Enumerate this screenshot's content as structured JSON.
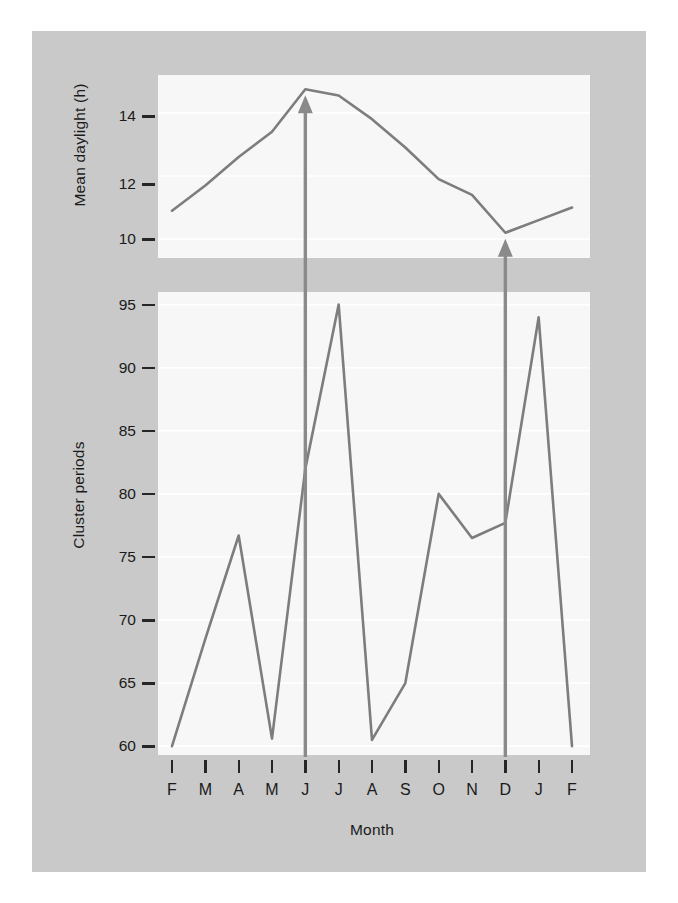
{
  "figure": {
    "background_color": "#c9c9c9",
    "panel_color": "#f7f7f7",
    "line_color": "#7d7d7d",
    "arrow_color": "#8a8a8a",
    "text_color": "#1a1a1a",
    "grid_color": "#ffffff"
  },
  "xaxis": {
    "label": "Month",
    "categories": [
      "F",
      "M",
      "A",
      "M",
      "J",
      "J",
      "A",
      "S",
      "O",
      "N",
      "D",
      "J",
      "F"
    ]
  },
  "chart_data": [
    {
      "type": "line",
      "id": "mean-daylight",
      "title": "",
      "xlabel": "",
      "ylabel": "Mean daylight (h)",
      "categories": [
        "F",
        "M",
        "A",
        "M",
        "J",
        "J",
        "A",
        "S",
        "O",
        "N",
        "D",
        "J",
        "F"
      ],
      "values": [
        10.9,
        11.7,
        12.6,
        13.4,
        14.75,
        14.55,
        13.8,
        12.9,
        11.9,
        11.4,
        10.2,
        10.6,
        11.0
      ],
      "yticks": [
        10,
        12,
        14
      ],
      "ytick_labels": [
        "10",
        "12",
        "14"
      ],
      "ylim": [
        9.4,
        15.2
      ],
      "grid": true,
      "legend": "none",
      "annotations": [
        {
          "name": "arrow-june-solstice",
          "x_category": "J",
          "x_index": 4,
          "points_to": "maximum",
          "value": 14.75
        },
        {
          "name": "arrow-december-solstice",
          "x_category": "D",
          "x_index": 10,
          "points_to": "minimum",
          "value": 10.2
        }
      ]
    },
    {
      "type": "line",
      "id": "cluster-periods",
      "title": "",
      "xlabel": "Month",
      "ylabel": "Cluster periods",
      "categories": [
        "F",
        "M",
        "A",
        "M",
        "J",
        "J",
        "A",
        "S",
        "O",
        "N",
        "D",
        "J",
        "F"
      ],
      "values": [
        60.0,
        68.5,
        76.7,
        60.6,
        82.0,
        95.0,
        60.5,
        65.0,
        80.0,
        76.5,
        77.7,
        94.0,
        60.0
      ],
      "yticks": [
        60,
        65,
        70,
        75,
        80,
        85,
        90,
        95
      ],
      "ytick_labels": [
        "60",
        "65",
        "70",
        "75",
        "80",
        "85",
        "90",
        "95"
      ],
      "ylim": [
        59.3,
        96.0
      ],
      "grid": true,
      "legend": "none",
      "annotations": [
        {
          "name": "arrow-june-solstice",
          "x_category": "J",
          "x_index": 4
        },
        {
          "name": "arrow-december-solstice",
          "x_category": "D",
          "x_index": 10
        }
      ]
    }
  ]
}
